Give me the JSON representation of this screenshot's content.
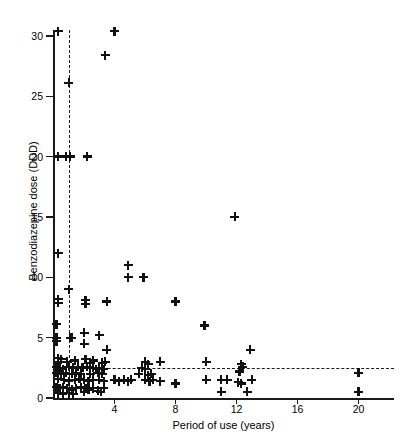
{
  "chart_data": {
    "type": "scatter",
    "title": "",
    "xlabel": "Period of use (years)",
    "ylabel": "Benzodiazepine dose (DDD)",
    "xlim": [
      0,
      22.3
    ],
    "ylim": [
      0,
      30.6
    ],
    "xticks": [
      4,
      8,
      12,
      16,
      20
    ],
    "yticks": [
      0,
      5,
      10,
      15,
      20,
      25,
      30
    ],
    "grid": false,
    "legend": null,
    "marker": "plus",
    "marker_color": "#111111",
    "axis_color": "#1a1a1a",
    "reference_lines": [
      {
        "orientation": "vertical",
        "value": 1.0,
        "style": "dashed",
        "label": ""
      },
      {
        "orientation": "horizontal",
        "value": 2.5,
        "style": "dashed",
        "label": ""
      }
    ],
    "points": [
      [
        0.3,
        30.4
      ],
      [
        4.0,
        30.4
      ],
      [
        3.4,
        28.4
      ],
      [
        1.0,
        26.1
      ],
      [
        0.3,
        20.0
      ],
      [
        0.8,
        20.0
      ],
      [
        1.1,
        20.0
      ],
      [
        2.2,
        20.0
      ],
      [
        11.9,
        15.0
      ],
      [
        0.3,
        12.0
      ],
      [
        4.9,
        11.0
      ],
      [
        4.9,
        10.0
      ],
      [
        5.9,
        10.0
      ],
      [
        1.0,
        9.0
      ],
      [
        0.3,
        8.2
      ],
      [
        0.3,
        7.9
      ],
      [
        2.1,
        8.1
      ],
      [
        2.1,
        7.8
      ],
      [
        3.5,
        8.0
      ],
      [
        8.0,
        8.0
      ],
      [
        9.9,
        6.0
      ],
      [
        0.2,
        6.1
      ],
      [
        0.2,
        5.0
      ],
      [
        0.2,
        4.7
      ],
      [
        1.2,
        5.0
      ],
      [
        2.0,
        5.4
      ],
      [
        3.0,
        5.2
      ],
      [
        1.1,
        5.0
      ],
      [
        12.9,
        4.0
      ],
      [
        3.5,
        4.0
      ],
      [
        2.0,
        4.5
      ],
      [
        0.3,
        3.3
      ],
      [
        0.3,
        3.0
      ],
      [
        0.5,
        3.2
      ],
      [
        0.9,
        3.0
      ],
      [
        1.4,
        3.1
      ],
      [
        2.1,
        3.2
      ],
      [
        2.4,
        2.9
      ],
      [
        2.6,
        3.1
      ],
      [
        3.2,
        2.9
      ],
      [
        3.4,
        3.0
      ],
      [
        6.0,
        3.0
      ],
      [
        6.2,
        2.8
      ],
      [
        7.0,
        3.0
      ],
      [
        10.0,
        3.0
      ],
      [
        12.3,
        2.8
      ],
      [
        12.4,
        2.6
      ],
      [
        0.2,
        2.6
      ],
      [
        0.4,
        2.5
      ],
      [
        0.6,
        2.4
      ],
      [
        1.0,
        2.6
      ],
      [
        1.3,
        2.5
      ],
      [
        1.6,
        2.6
      ],
      [
        1.9,
        2.5
      ],
      [
        2.2,
        2.6
      ],
      [
        2.6,
        2.5
      ],
      [
        2.8,
        2.4
      ],
      [
        3.0,
        2.5
      ],
      [
        3.3,
        2.4
      ],
      [
        5.8,
        2.5
      ],
      [
        6.0,
        2.4
      ],
      [
        12.2,
        2.2
      ],
      [
        20.0,
        2.1
      ],
      [
        0.2,
        2.1
      ],
      [
        0.5,
        2.0
      ],
      [
        0.8,
        2.1
      ],
      [
        1.2,
        2.0
      ],
      [
        1.5,
        2.1
      ],
      [
        1.8,
        2.0
      ],
      [
        2.4,
        2.0
      ],
      [
        2.9,
        2.1
      ],
      [
        3.2,
        2.0
      ],
      [
        5.6,
        2.0
      ],
      [
        6.2,
        1.9
      ],
      [
        6.4,
        2.0
      ],
      [
        0.3,
        1.6
      ],
      [
        0.7,
        1.5
      ],
      [
        1.0,
        1.4
      ],
      [
        1.4,
        1.5
      ],
      [
        1.7,
        1.6
      ],
      [
        2.0,
        1.5
      ],
      [
        2.3,
        1.4
      ],
      [
        2.6,
        1.5
      ],
      [
        3.0,
        1.5
      ],
      [
        3.3,
        1.4
      ],
      [
        4.0,
        1.5
      ],
      [
        4.3,
        1.4
      ],
      [
        4.6,
        1.5
      ],
      [
        4.9,
        1.4
      ],
      [
        5.1,
        1.5
      ],
      [
        6.0,
        1.5
      ],
      [
        6.3,
        1.4
      ],
      [
        6.5,
        1.5
      ],
      [
        7.0,
        1.4
      ],
      [
        8.0,
        1.2
      ],
      [
        10.0,
        1.5
      ],
      [
        11.0,
        1.5
      ],
      [
        11.4,
        1.5
      ],
      [
        12.1,
        1.3
      ],
      [
        12.3,
        1.2
      ],
      [
        13.0,
        1.5
      ],
      [
        0.2,
        0.9
      ],
      [
        0.4,
        0.8
      ],
      [
        0.6,
        0.9
      ],
      [
        0.9,
        0.8
      ],
      [
        1.2,
        0.7
      ],
      [
        1.5,
        0.8
      ],
      [
        1.8,
        0.9
      ],
      [
        2.1,
        0.8
      ],
      [
        2.3,
        0.7
      ],
      [
        2.6,
        0.8
      ],
      [
        2.9,
        0.6
      ],
      [
        3.1,
        0.5
      ],
      [
        3.3,
        0.8
      ],
      [
        0.3,
        0.4
      ],
      [
        0.6,
        0.3
      ],
      [
        1.0,
        0.4
      ],
      [
        1.3,
        0.3
      ],
      [
        2.0,
        0.5
      ],
      [
        11.0,
        0.5
      ],
      [
        12.7,
        0.5
      ],
      [
        20.0,
        0.5
      ]
    ]
  }
}
